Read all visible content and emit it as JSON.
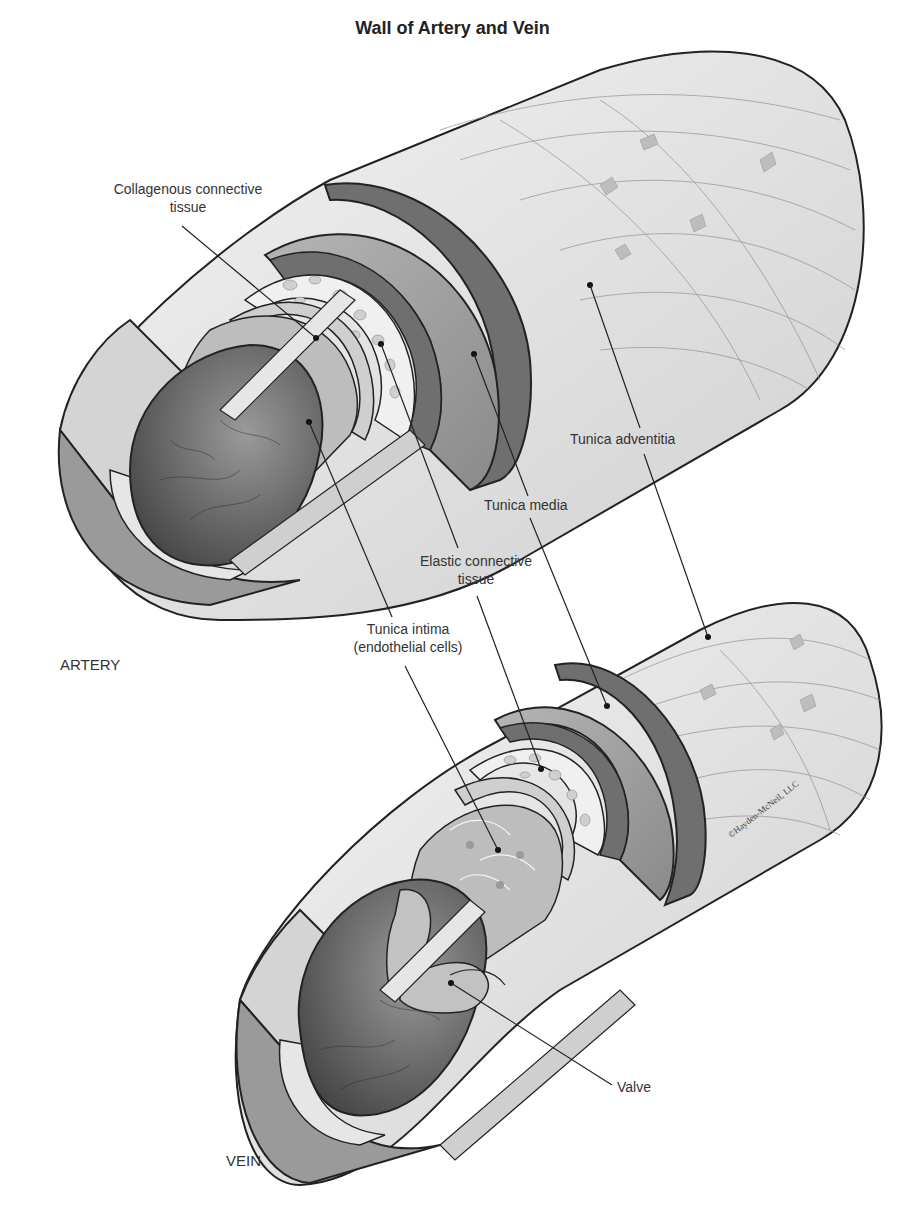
{
  "title": "Wall of Artery and Vein",
  "vessels": {
    "artery": "ARTERY",
    "vein": "VEIN"
  },
  "labels": {
    "collagenous": [
      "Collagenous connective",
      "tissue"
    ],
    "tunica_adventitia": "Tunica adventitia",
    "tunica_media": "Tunica media",
    "elastic": [
      "Elastic connective",
      "tissue"
    ],
    "tunica_intima": [
      "Tunica intima",
      "(endothelial cells)"
    ],
    "valve": "Valve"
  },
  "credit": "©Hayden-McNeil, LLC",
  "colors": {
    "adventitia": "#e4e4e4",
    "media": "#9a9a9a",
    "media_band": "#6f6f6f",
    "elastic": "#f0f0f0",
    "intima": "#bdbdbd",
    "lumen": "#5e5e5e",
    "outline": "#222222"
  }
}
